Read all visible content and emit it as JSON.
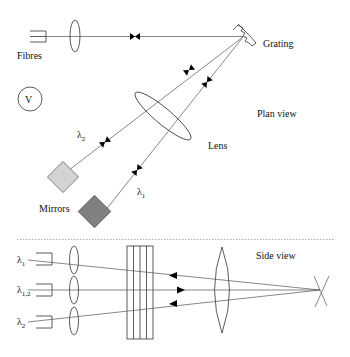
{
  "diagram": {
    "colors": {
      "line": "#333333",
      "mirror_light": "#d3d3d3",
      "mirror_dark": "#808080",
      "separator": "#999999",
      "marker": "#000000"
    },
    "plan_view": {
      "label": "Plan view",
      "labels": {
        "fibres": "Fibres",
        "grating": "Grating",
        "lens": "Lens",
        "mirrors": "Mirrors",
        "v_symbol": "V",
        "lambda2_main": "λ",
        "lambda2_sub": "2",
        "lambda1_main": "λ",
        "lambda1_sub": "1"
      },
      "components": [
        "fibre-bundle",
        "collimator-lens",
        "grating",
        "camera-lens",
        "mirror-lambda2",
        "mirror-lambda1"
      ]
    },
    "side_view": {
      "label": "Side view",
      "fibre_labels": [
        {
          "main": "λ",
          "sub": "1"
        },
        {
          "main": "λ",
          "sub": "1,2"
        },
        {
          "main": "λ",
          "sub": "2"
        }
      ],
      "components": [
        "three-fibres",
        "three-lenses",
        "stacked-plates",
        "large-lens",
        "crossing-point"
      ]
    }
  }
}
